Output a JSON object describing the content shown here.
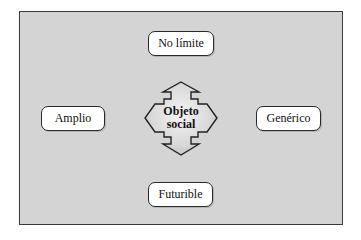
{
  "diagram": {
    "center": {
      "line1": "Objeto",
      "line2": "social"
    },
    "nodes": {
      "top": "No límite",
      "left": "Amplio",
      "right": "Genérico",
      "bottom": "Futurible"
    },
    "colors": {
      "background": "#d4d4d4",
      "node_fill": "#ffffff",
      "border": "#2a2a2a"
    }
  }
}
